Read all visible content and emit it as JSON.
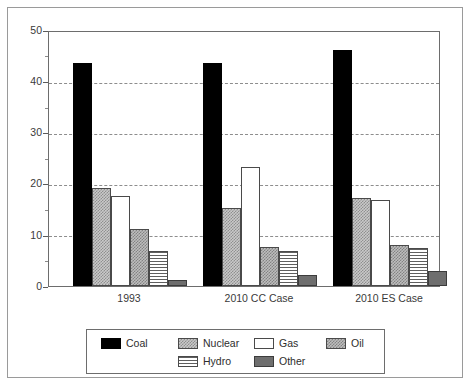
{
  "chart_data": {
    "type": "bar",
    "title": "",
    "subtitle": "",
    "xlabel": "",
    "ylabel": "",
    "ylim": [
      0,
      50
    ],
    "yticks": [
      0,
      10,
      20,
      30,
      40,
      50
    ],
    "ytick_labels": [
      "0",
      "10",
      "20",
      "30",
      "40",
      "50"
    ],
    "yminor_ticks": [
      5,
      15,
      25,
      35,
      45
    ],
    "grid": "horizontal-dashed",
    "legend_position": "bottom-outside",
    "categories": [
      "1993",
      "2010 CC Case",
      "2010 ES Case"
    ],
    "series": [
      {
        "name": "Coal",
        "color": "#000000",
        "pattern": "solid-black",
        "values": [
          43.5,
          43.5,
          46.0
        ]
      },
      {
        "name": "Nuclear",
        "color": "#c9c9c9",
        "pattern": "light-checker",
        "values": [
          19.2,
          15.3,
          17.2
        ]
      },
      {
        "name": "Gas",
        "color": "#ffffff",
        "pattern": "white-outline",
        "values": [
          17.6,
          23.2,
          16.8
        ]
      },
      {
        "name": "Oil",
        "color": "#bdbdbd",
        "pattern": "gray-checker",
        "values": [
          11.2,
          7.7,
          8.0
        ]
      },
      {
        "name": "Hydro",
        "color": "#ffffff",
        "pattern": "horizontal-lines",
        "values": [
          6.8,
          6.9,
          7.5
        ]
      },
      {
        "name": "Other",
        "color": "#6e6e6e",
        "pattern": "solid-dark-gray",
        "values": [
          1.2,
          2.2,
          3.0
        ]
      }
    ]
  },
  "legend": {
    "items": [
      {
        "label": "Coal"
      },
      {
        "label": "Nuclear"
      },
      {
        "label": "Gas"
      },
      {
        "label": "Oil"
      },
      {
        "label": "Hydro"
      },
      {
        "label": "Other"
      }
    ]
  },
  "axis": {
    "y_labels": [
      "50",
      "40",
      "30",
      "20",
      "10",
      "0"
    ],
    "x_labels": [
      "1993",
      "2010 CC Case",
      "2010 ES Case"
    ]
  }
}
